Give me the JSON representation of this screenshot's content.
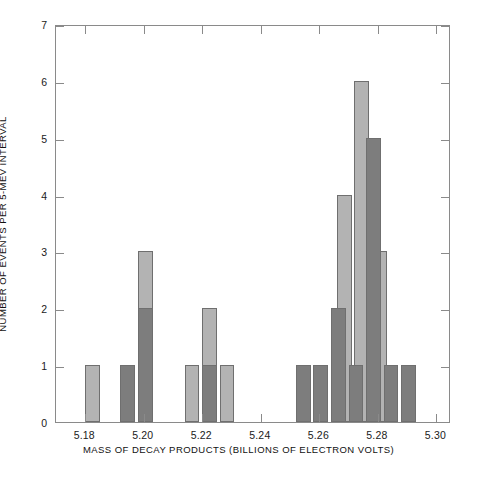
{
  "chart_data": {
    "type": "bar",
    "title": "",
    "subtitle": "",
    "xlabel": "MASS OF DECAY PRODUCTS (BILLIONS OF ELECTRON VOLTS)",
    "ylabel": "NUMBER OF EVENTS PER 5-MEV INTERVAL",
    "xlim": [
      5.17,
      5.305
    ],
    "ylim": [
      0,
      7
    ],
    "bin_width": 0.005,
    "grid": false,
    "legend": false,
    "xticks": [
      {
        "value": 5.18,
        "label": "5.18"
      },
      {
        "value": 5.2,
        "label": "5.20"
      },
      {
        "value": 5.22,
        "label": "5.22"
      },
      {
        "value": 5.24,
        "label": "5.24"
      },
      {
        "value": 5.26,
        "label": "5.26"
      },
      {
        "value": 5.28,
        "label": "5.28"
      },
      {
        "value": 5.3,
        "label": "5.30"
      }
    ],
    "yticks": [
      {
        "value": 0,
        "label": "0"
      },
      {
        "value": 1,
        "label": "1"
      },
      {
        "value": 2,
        "label": "2"
      },
      {
        "value": 3,
        "label": "3"
      },
      {
        "value": 4,
        "label": "4"
      },
      {
        "value": 5,
        "label": "5"
      },
      {
        "value": 6,
        "label": "6"
      },
      {
        "value": 7,
        "label": "7"
      }
    ],
    "colors": {
      "series_a": "#b3b3b3",
      "series_b": "#7d7d7d",
      "bar_edge": "#6f6f6f",
      "axis": "#8a8a8a",
      "text": "#111111",
      "background": "#ffffff"
    },
    "series": [
      {
        "name": "series-a",
        "color": "#b3b3b3",
        "bins": [
          {
            "x": 5.18,
            "value": 1
          },
          {
            "x": 5.198,
            "value": 3
          },
          {
            "x": 5.214,
            "value": 1
          },
          {
            "x": 5.22,
            "value": 2
          },
          {
            "x": 5.226,
            "value": 1
          },
          {
            "x": 5.266,
            "value": 4
          },
          {
            "x": 5.272,
            "value": 6
          },
          {
            "x": 5.278,
            "value": 3
          }
        ]
      },
      {
        "name": "series-b",
        "color": "#7d7d7d",
        "bins": [
          {
            "x": 5.192,
            "value": 1
          },
          {
            "x": 5.198,
            "value": 2
          },
          {
            "x": 5.22,
            "value": 1
          },
          {
            "x": 5.252,
            "value": 1
          },
          {
            "x": 5.258,
            "value": 1
          },
          {
            "x": 5.264,
            "value": 2
          },
          {
            "x": 5.27,
            "value": 1
          },
          {
            "x": 5.276,
            "value": 5
          },
          {
            "x": 5.282,
            "value": 1
          },
          {
            "x": 5.288,
            "value": 1
          }
        ]
      }
    ]
  }
}
